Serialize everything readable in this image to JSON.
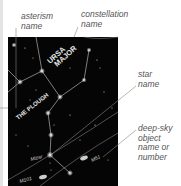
{
  "labels": {
    "asterism": [
      "asterism",
      "name"
    ],
    "constellation": [
      "constellation",
      "name"
    ],
    "star": [
      "star",
      "name"
    ],
    "deep_sky": [
      "deep-sky",
      "object",
      "name or",
      "number"
    ]
  },
  "map": {
    "constellation_name": [
      "URSA",
      "MAJOR"
    ],
    "asterism_name": "THE PLOUGH",
    "star_name": "Mizar",
    "objects": [
      "M101",
      "M51"
    ]
  },
  "colors": {
    "background": "#ffffff",
    "sky": "#050505",
    "label_text": "#555555",
    "star": "#ffffff"
  }
}
